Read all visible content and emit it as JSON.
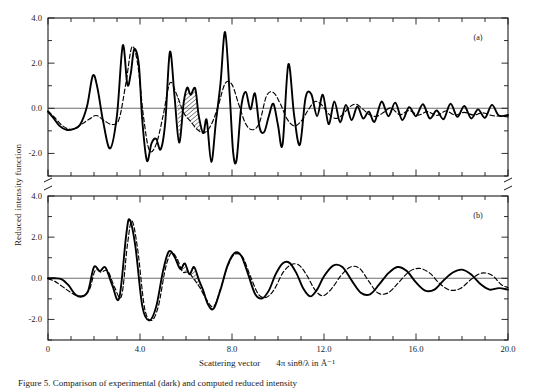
{
  "figure": {
    "ylabel": "Reduced intensity function",
    "xlabel_main": "Scattering vector",
    "xlabel_expr": "4π sinθ/λ in Å⁻¹",
    "caption": "Figure 5. Comparison of experimental (dark) and computed reduced intensity",
    "panel_a_label": "(a)",
    "panel_b_label": "(b)",
    "colors": {
      "axis": "#1a1a1a",
      "solid_curve": "#000000",
      "dashed_curve": "#000000",
      "zero_line": "#6e6e6e",
      "background": "#ffffff"
    }
  },
  "chart_data": [
    {
      "type": "line",
      "panel": "(a)",
      "title": "",
      "xlabel": "Scattering vector  4π sinθ/λ in Å⁻¹",
      "ylabel": "Reduced intensity function",
      "xlim": [
        0,
        20.0
      ],
      "ylim": [
        -3.0,
        4.0
      ],
      "xticks": [
        0,
        4.0,
        8.0,
        12.0,
        16.0,
        20.0
      ],
      "xtick_labels": [
        "0",
        "4.0",
        "8.0",
        "12.0",
        "16.0",
        "20.0"
      ],
      "xminor_step": 1.0,
      "yticks": [
        -2.0,
        0.0,
        2.0,
        4.0
      ],
      "ytick_labels": [
        "-2.0",
        "0.0",
        "2.0",
        "4.0"
      ],
      "yminor_step": 1.0,
      "grid": false,
      "legend": false,
      "zero_line": 0.0,
      "series": [
        {
          "name": "experimental",
          "style": "solid",
          "x": [
            0.0,
            0.25,
            0.5,
            0.8,
            1.1,
            1.4,
            1.7,
            1.95,
            2.15,
            2.4,
            2.7,
            3.0,
            3.25,
            3.45,
            3.6,
            3.75,
            3.95,
            4.1,
            4.3,
            4.5,
            4.7,
            4.9,
            5.1,
            5.3,
            5.5,
            5.7,
            5.9,
            6.05,
            6.2,
            6.4,
            6.55,
            6.75,
            6.9,
            7.1,
            7.3,
            7.5,
            7.7,
            7.9,
            8.05,
            8.2,
            8.4,
            8.6,
            8.8,
            9.0,
            9.2,
            9.4,
            9.6,
            9.8,
            10.0,
            10.2,
            10.45,
            10.7,
            10.95,
            11.2,
            11.45,
            11.7,
            11.95,
            12.2,
            12.45,
            12.7,
            12.95,
            13.2,
            13.45,
            13.7,
            13.95,
            14.2,
            14.5,
            14.8,
            15.1,
            15.4,
            15.7,
            16.0,
            16.3,
            16.6,
            16.9,
            17.2,
            17.5,
            17.8,
            18.1,
            18.4,
            18.7,
            19.0,
            19.3,
            19.6,
            20.0
          ],
          "y": [
            -0.15,
            -0.45,
            -0.78,
            -0.95,
            -0.92,
            -0.72,
            0.1,
            1.45,
            0.9,
            -0.6,
            -1.78,
            -0.3,
            2.78,
            1.05,
            1.55,
            2.62,
            1.92,
            -0.55,
            -2.32,
            -1.55,
            -1.35,
            -1.82,
            -0.6,
            2.5,
            0.55,
            -1.52,
            0.25,
            0.92,
            0.6,
            0.88,
            -0.3,
            -1.1,
            -0.52,
            -2.38,
            -0.6,
            1.1,
            3.38,
            0.6,
            -1.95,
            -2.28,
            0.05,
            0.72,
            -0.05,
            0.65,
            -0.85,
            -1.05,
            -0.35,
            0.2,
            -0.75,
            -1.6,
            1.95,
            -0.3,
            -1.62,
            0.48,
            0.62,
            -0.35,
            0.6,
            -0.7,
            0.3,
            -0.62,
            0.15,
            -0.52,
            0.08,
            -0.45,
            -0.15,
            -0.6,
            0.3,
            -0.35,
            0.25,
            -0.52,
            0.05,
            -0.35,
            0.18,
            -0.45,
            -0.1,
            -0.48,
            0.2,
            -0.38,
            0.1,
            -0.45,
            -0.05,
            -0.42,
            0.15,
            -0.32,
            -0.3,
            -0.42
          ]
        },
        {
          "name": "computed",
          "style": "dashed",
          "x": [
            0.0,
            0.3,
            0.6,
            0.9,
            1.2,
            1.5,
            1.8,
            2.1,
            2.45,
            2.8,
            3.1,
            3.4,
            3.65,
            3.9,
            4.15,
            4.4,
            4.7,
            5.0,
            5.3,
            5.6,
            5.9,
            6.2,
            6.5,
            6.8,
            7.1,
            7.4,
            7.7,
            8.0,
            8.3,
            8.6,
            8.9,
            9.2,
            9.5,
            9.8,
            10.1,
            10.4,
            10.7,
            11.0,
            11.3,
            11.6,
            11.9,
            12.2,
            12.5,
            12.8,
            13.1,
            13.4,
            13.7,
            14.0,
            14.3,
            14.6,
            14.9,
            15.3,
            15.7,
            16.1,
            16.5,
            16.9,
            17.3,
            17.7,
            18.1,
            18.5,
            18.9,
            19.3,
            19.7,
            20.0
          ],
          "y": [
            -0.12,
            -0.42,
            -0.75,
            -0.92,
            -0.9,
            -0.68,
            -0.48,
            -0.32,
            -0.55,
            -0.72,
            -0.45,
            1.2,
            2.72,
            1.95,
            -0.35,
            -1.85,
            -1.6,
            -0.35,
            1.12,
            0.6,
            -0.2,
            -0.58,
            -0.95,
            -1.08,
            -0.72,
            0.1,
            1.1,
            1.05,
            0.15,
            -0.7,
            -0.95,
            -0.62,
            0.55,
            0.7,
            0.2,
            -0.48,
            -0.78,
            -0.58,
            -0.1,
            0.3,
            0.15,
            -0.25,
            -0.45,
            -0.3,
            0.05,
            0.18,
            -0.05,
            -0.3,
            -0.35,
            -0.18,
            0.02,
            -0.28,
            -0.1,
            -0.3,
            -0.15,
            -0.32,
            -0.12,
            -0.3,
            -0.18,
            -0.3,
            -0.2,
            -0.32,
            -0.35,
            -0.38
          ]
        }
      ]
    },
    {
      "type": "line",
      "panel": "(b)",
      "title": "",
      "xlabel": "Scattering vector  4π sinθ/λ in Å⁻¹",
      "ylabel": "Reduced intensity function",
      "xlim": [
        0,
        20.0
      ],
      "ylim": [
        -3.0,
        4.0
      ],
      "xticks": [
        0,
        4.0,
        8.0,
        12.0,
        16.0,
        20.0
      ],
      "xtick_labels": [
        "0",
        "4.0",
        "8.0",
        "12.0",
        "16.0",
        "20.0"
      ],
      "xminor_step": 1.0,
      "yticks": [
        -2.0,
        0.0,
        2.0,
        4.0
      ],
      "ytick_labels": [
        "-2.0",
        "0.0",
        "2.0",
        "4.0"
      ],
      "yminor_step": 1.0,
      "grid": false,
      "legend": false,
      "zero_line": 0.0,
      "series": [
        {
          "name": "experimental",
          "style": "solid",
          "x": [
            0.0,
            0.3,
            0.6,
            0.9,
            1.2,
            1.5,
            1.75,
            2.0,
            2.25,
            2.5,
            2.8,
            3.1,
            3.4,
            3.55,
            3.8,
            4.1,
            4.4,
            4.7,
            5.0,
            5.25,
            5.5,
            5.75,
            5.95,
            6.15,
            6.35,
            6.55,
            6.75,
            6.95,
            7.2,
            7.5,
            7.8,
            8.1,
            8.4,
            8.7,
            9.0,
            9.3,
            9.6,
            9.9,
            10.2,
            10.5,
            10.8,
            11.1,
            11.4,
            11.7,
            12.0,
            12.4,
            12.8,
            13.2,
            13.6,
            14.0,
            14.4,
            14.8,
            15.2,
            15.6,
            16.0,
            16.4,
            16.8,
            17.2,
            17.6,
            18.0,
            18.4,
            18.8,
            19.2,
            19.6,
            20.0
          ],
          "y": [
            0.0,
            0.0,
            -0.05,
            -0.35,
            -0.8,
            -0.88,
            -0.6,
            0.55,
            0.35,
            0.52,
            -0.35,
            -0.95,
            2.1,
            2.85,
            1.55,
            -1.35,
            -2.05,
            -1.4,
            0.35,
            1.3,
            1.05,
            0.45,
            0.72,
            0.2,
            0.55,
            -0.05,
            -0.6,
            -1.25,
            -1.48,
            -0.55,
            0.6,
            1.22,
            1.1,
            0.2,
            -0.75,
            -0.98,
            -0.6,
            0.2,
            0.72,
            0.75,
            0.25,
            -0.5,
            -0.88,
            -0.55,
            0.1,
            0.62,
            0.55,
            -0.1,
            -0.7,
            -0.78,
            -0.3,
            0.25,
            0.55,
            0.35,
            -0.2,
            -0.6,
            -0.55,
            -0.1,
            0.28,
            0.42,
            0.18,
            -0.28,
            -0.55,
            -0.48,
            -0.55
          ]
        },
        {
          "name": "computed",
          "style": "dashed",
          "x": [
            0.0,
            0.3,
            0.6,
            0.9,
            1.2,
            1.5,
            1.8,
            2.05,
            2.3,
            2.6,
            2.9,
            3.2,
            3.45,
            3.65,
            3.9,
            4.2,
            4.5,
            4.8,
            5.1,
            5.35,
            5.6,
            5.85,
            6.1,
            6.35,
            6.6,
            6.9,
            7.2,
            7.5,
            7.8,
            8.1,
            8.45,
            8.8,
            9.15,
            9.5,
            9.85,
            10.2,
            10.55,
            10.9,
            11.25,
            11.6,
            11.95,
            12.35,
            12.75,
            13.15,
            13.55,
            13.95,
            14.35,
            14.8,
            15.25,
            15.7,
            16.15,
            16.6,
            17.05,
            17.5,
            17.95,
            18.4,
            18.85,
            19.3,
            19.7,
            20.0
          ],
          "y": [
            -0.02,
            -0.15,
            -0.38,
            -0.62,
            -0.82,
            -0.85,
            -0.55,
            0.38,
            0.3,
            0.35,
            -0.45,
            -0.85,
            1.6,
            2.78,
            1.4,
            -1.45,
            -2.05,
            -1.35,
            0.45,
            1.22,
            0.98,
            0.32,
            0.3,
            -0.05,
            -0.45,
            -1.05,
            -1.38,
            -0.52,
            0.55,
            1.15,
            1.05,
            0.1,
            -0.78,
            -0.92,
            -0.52,
            0.25,
            0.65,
            0.65,
            0.15,
            -0.55,
            -0.85,
            -0.48,
            0.15,
            0.55,
            0.48,
            -0.15,
            -0.72,
            -0.7,
            -0.2,
            0.32,
            0.48,
            0.25,
            -0.28,
            -0.58,
            -0.48,
            -0.05,
            0.25,
            0.15,
            -0.3,
            -0.45
          ]
        }
      ]
    }
  ]
}
